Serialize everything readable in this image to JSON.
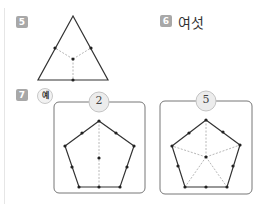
{
  "problems": [
    {
      "number": "5",
      "badge_color": "#a8a8a8"
    },
    {
      "number": "6",
      "badge_color": "#a8a8a8",
      "answer": "여섯"
    },
    {
      "number": "7",
      "badge_color": "#a8a8a8",
      "example_label": "예",
      "figures": [
        {
          "circle_label": "2"
        },
        {
          "circle_label": "5"
        }
      ]
    }
  ],
  "colors": {
    "line": "#333333",
    "dashed": "#b8b8b8",
    "box_border": "#777777",
    "circle_fill": "#ececec",
    "circle_border": "#c4c4c4"
  }
}
